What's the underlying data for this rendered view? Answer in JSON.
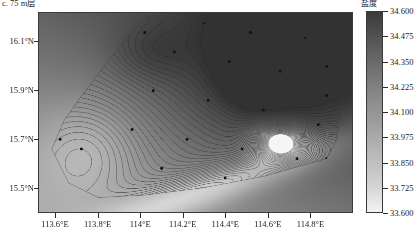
{
  "panel": {
    "title": "c. 75 m层"
  },
  "colorbar": {
    "title": "盐度",
    "ticks": [
      "34.600",
      "34.475",
      "34.350",
      "34.225",
      "34.100",
      "33.975",
      "33.850",
      "33.725",
      "33.600"
    ],
    "tick_values": [
      34.6,
      34.475,
      34.35,
      34.225,
      34.1,
      33.975,
      33.85,
      33.725,
      33.6
    ],
    "vmin": 33.6,
    "vmax": 34.6,
    "high_color": "#3b3b3b",
    "low_color": "#f2f2f2"
  },
  "axes": {
    "y_labels": [
      "16.1°N",
      "15.9°N",
      "15.7°N",
      "15.5°N"
    ],
    "y_values": [
      16.1,
      15.9,
      15.7,
      15.5
    ],
    "x_labels": [
      "113.6°E",
      "113.8°E",
      "114°E",
      "114.2°E",
      "114.4°E",
      "114.6°E",
      "114.8°E"
    ],
    "x_values": [
      113.6,
      113.8,
      114.0,
      114.2,
      114.4,
      114.6,
      114.8
    ],
    "xlim": [
      113.52,
      115.0
    ],
    "ylim": [
      15.4,
      16.22
    ]
  },
  "chart_data": {
    "type": "heatmap",
    "title": "c. 75 m层",
    "xlabel": "",
    "ylabel": "",
    "legend_title": "盐度",
    "colormap": "gray_reversed",
    "grid": false,
    "contour_interval": 0.025,
    "xlim": [
      113.52,
      115.0
    ],
    "ylim": [
      15.4,
      16.22
    ],
    "zlim": [
      33.6,
      34.6
    ],
    "boundary_polygon": [
      [
        114.02,
        16.2
      ],
      [
        114.3,
        16.18
      ],
      [
        114.55,
        16.16
      ],
      [
        114.78,
        16.12
      ],
      [
        114.92,
        16.04
      ],
      [
        114.95,
        15.86
      ],
      [
        114.93,
        15.7
      ],
      [
        114.88,
        15.62
      ],
      [
        114.6,
        15.55
      ],
      [
        114.3,
        15.5
      ],
      [
        114.02,
        15.47
      ],
      [
        113.8,
        15.46
      ],
      [
        113.66,
        15.52
      ],
      [
        113.58,
        15.66
      ],
      [
        113.64,
        15.78
      ],
      [
        113.74,
        15.9
      ],
      [
        113.86,
        16.04
      ],
      [
        114.02,
        16.2
      ]
    ],
    "stations": [
      [
        114.02,
        16.14
      ],
      [
        114.3,
        16.18
      ],
      [
        114.52,
        16.14
      ],
      [
        114.78,
        16.12
      ],
      [
        114.88,
        16.0
      ],
      [
        114.16,
        16.06
      ],
      [
        114.42,
        16.02
      ],
      [
        114.66,
        15.98
      ],
      [
        114.88,
        15.88
      ],
      [
        114.06,
        15.9
      ],
      [
        114.32,
        15.86
      ],
      [
        114.58,
        15.82
      ],
      [
        114.84,
        15.76
      ],
      [
        113.96,
        15.74
      ],
      [
        114.22,
        15.7
      ],
      [
        114.48,
        15.66
      ],
      [
        114.74,
        15.62
      ],
      [
        113.72,
        15.66
      ],
      [
        113.62,
        15.7
      ],
      [
        114.1,
        15.58
      ],
      [
        114.4,
        15.54
      ],
      [
        114.88,
        15.62
      ]
    ],
    "extrema": [
      {
        "kind": "high",
        "x": 114.55,
        "y": 15.95,
        "value": 34.58
      },
      {
        "kind": "high",
        "x": 114.0,
        "y": 16.06,
        "value": 34.5
      },
      {
        "kind": "low",
        "x": 114.66,
        "y": 15.7,
        "value": 33.62
      },
      {
        "kind": "low",
        "x": 113.7,
        "y": 15.62,
        "value": 34.18
      }
    ]
  }
}
